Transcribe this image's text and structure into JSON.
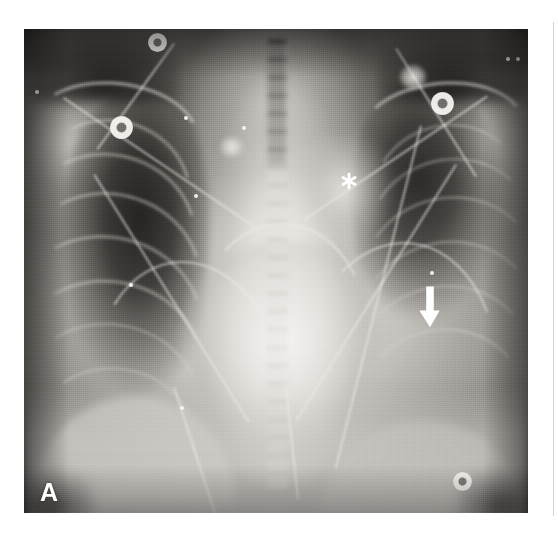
{
  "figure": {
    "panel_label": "A",
    "modality": "chest-radiograph",
    "view": "frontal-ap-portable",
    "background_color": "#ffffff"
  },
  "radiograph": {
    "frame": {
      "x": 24,
      "y": 29,
      "width": 504,
      "height": 484
    },
    "tone": {
      "lung_field_dark": "#2a2725",
      "soft_tissue_mid": "#8a8782",
      "mediastinum_bright": "#f6f5f2",
      "border_dark": "#1d1b1a"
    }
  },
  "annotations": {
    "asterisk": {
      "glyph": "*",
      "color": "#ffffff",
      "x": 340,
      "y": 183,
      "points_to": "widened-upper-mediastinum"
    },
    "arrow": {
      "glyph": "down-arrow",
      "color": "#ffffff",
      "x": 427,
      "y": 306,
      "direction": "down",
      "points_to": "left-lower-lung-opacity"
    },
    "panel_letter": {
      "text": "A",
      "color": "#ffffff",
      "x": 42,
      "y": 496
    }
  },
  "devices": {
    "ecg_electrodes": [
      {
        "name": "electrode-upper-right",
        "cx": 158,
        "cy": 42,
        "r": 9
      },
      {
        "name": "electrode-mid-right",
        "cx": 122,
        "cy": 127,
        "r": 11
      },
      {
        "name": "electrode-upper-left",
        "cx": 443,
        "cy": 103,
        "r": 11
      },
      {
        "name": "electrode-lower-left",
        "cx": 462,
        "cy": 481,
        "r": 9
      }
    ],
    "metal_dots": [
      {
        "name": "marker-dot-top-right-a",
        "cx": 508,
        "cy": 59,
        "r": 2
      },
      {
        "name": "marker-dot-top-right-b",
        "cx": 518,
        "cy": 59,
        "r": 2
      },
      {
        "name": "marker-dot-right-lung-a",
        "cx": 186,
        "cy": 118,
        "r": 2
      },
      {
        "name": "marker-dot-right-lung-b",
        "cx": 196,
        "cy": 196,
        "r": 2
      },
      {
        "name": "marker-dot-right-lung-c",
        "cx": 131,
        "cy": 285,
        "r": 2
      },
      {
        "name": "marker-dot-right-lung-d",
        "cx": 182,
        "cy": 408,
        "r": 2
      },
      {
        "name": "marker-dot-left-lung",
        "cx": 432,
        "cy": 273,
        "r": 2
      },
      {
        "name": "marker-dot-apex-left",
        "cx": 244,
        "cy": 128,
        "r": 2
      },
      {
        "name": "marker-dot-shoulder-right",
        "cx": 37,
        "cy": 92,
        "r": 2
      }
    ]
  },
  "findings": {
    "mediastinum": "widened",
    "left_lower_lung": "opacity",
    "right_lung": "aerated-with-rib-detail"
  }
}
